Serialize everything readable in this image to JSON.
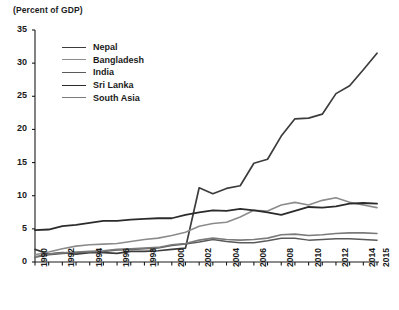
{
  "chart_data": {
    "type": "line",
    "title": "(Percent of GDP)",
    "xlabel": "",
    "ylabel": "(Percent of GDP)",
    "xlim": [
      1990,
      2015
    ],
    "ylim": [
      0,
      35
    ],
    "yticks": [
      0,
      5,
      10,
      15,
      20,
      25,
      30,
      35
    ],
    "xticks": [
      1990,
      1992,
      1994,
      1996,
      1998,
      2000,
      2002,
      2004,
      2006,
      2008,
      2010,
      2012,
      2014,
      2015
    ],
    "xtick_labels": [
      "1990",
      "1992",
      "1994",
      "1996",
      "1998",
      "2000",
      "2002",
      "2004",
      "2006",
      "2008",
      "2010",
      "2012",
      "2014",
      "2015"
    ],
    "grid": false,
    "legend_position": "upper-left-inside",
    "x": [
      1990,
      1991,
      1992,
      1993,
      1994,
      1995,
      1996,
      1997,
      1998,
      1999,
      2000,
      2001,
      2002,
      2003,
      2004,
      2005,
      2006,
      2007,
      2008,
      2009,
      2010,
      2011,
      2012,
      2013,
      2014,
      2015
    ],
    "series": [
      {
        "name": "Nepal",
        "color": "#3c3c3c",
        "width": 1.7,
        "values": [
          1.9,
          1.2,
          1.4,
          1.2,
          1.4,
          1.4,
          1.3,
          1.6,
          1.6,
          1.7,
          1.9,
          2.1,
          11.2,
          10.3,
          11.1,
          11.5,
          14.9,
          15.5,
          19.0,
          21.6,
          21.7,
          22.3,
          25.4,
          26.6,
          29.0,
          31.5
        ]
      },
      {
        "name": "Bangladesh",
        "color": "#8c8c8c",
        "width": 1.6,
        "values": [
          1.1,
          1.5,
          2.0,
          2.4,
          2.6,
          2.7,
          2.8,
          3.1,
          3.4,
          3.6,
          4.0,
          4.5,
          5.4,
          5.8,
          6.0,
          6.8,
          7.8,
          7.7,
          8.6,
          9.0,
          8.6,
          9.3,
          9.7,
          9.0,
          8.6,
          8.2
        ]
      },
      {
        "name": "India",
        "color": "#5a5a5a",
        "width": 1.5,
        "values": [
          0.7,
          1.1,
          1.3,
          1.4,
          1.5,
          1.6,
          1.8,
          1.9,
          2.0,
          2.1,
          2.5,
          2.7,
          3.0,
          3.4,
          3.1,
          2.9,
          2.9,
          3.2,
          3.6,
          3.6,
          3.3,
          3.4,
          3.5,
          3.5,
          3.4,
          3.3
        ]
      },
      {
        "name": "Sri Lanka",
        "color": "#2b2b2b",
        "width": 1.8,
        "values": [
          4.8,
          4.9,
          5.4,
          5.6,
          5.9,
          6.2,
          6.2,
          6.4,
          6.5,
          6.6,
          6.6,
          7.1,
          7.5,
          7.8,
          7.7,
          8.0,
          7.8,
          7.5,
          7.1,
          7.7,
          8.3,
          8.2,
          8.4,
          8.8,
          8.9,
          8.8
        ]
      },
      {
        "name": "South Asia",
        "color": "#7a7a7a",
        "width": 1.6,
        "values": [
          0.8,
          1.2,
          1.4,
          1.5,
          1.6,
          1.7,
          1.9,
          2.0,
          2.1,
          2.2,
          2.6,
          2.8,
          3.3,
          3.6,
          3.4,
          3.3,
          3.4,
          3.6,
          4.1,
          4.2,
          4.0,
          4.1,
          4.3,
          4.4,
          4.4,
          4.3
        ]
      }
    ],
    "legend": [
      "Nepal",
      "Bangladesh",
      "India",
      "Sri Lanka",
      "South Asia"
    ]
  },
  "layout": {
    "plot_left": 35,
    "plot_right": 377,
    "plot_top": 30,
    "plot_bottom": 262,
    "axis_color": "#1a1a1a"
  }
}
